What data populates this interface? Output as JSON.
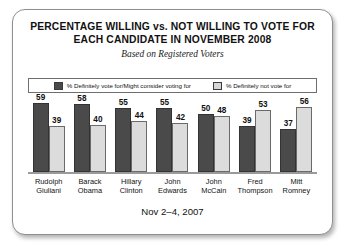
{
  "card": {
    "title_line1": "PERCENTAGE WILLING vs. NOT WILLING TO VOTE FOR",
    "title_line2": "EACH CANDIDATE IN NOVEMBER 2008",
    "subtitle": "Based on Registered Voters",
    "footer": "Nov 2–4, 2007"
  },
  "legend": {
    "series1_label": "% Definitely vote for/Might consider voting for",
    "series1_color": "#4a4a4a",
    "series2_label": "% Definitely not vote for",
    "series2_color": "#dcdcdc"
  },
  "chart_data": {
    "type": "bar",
    "title": "PERCENTAGE WILLING vs. NOT WILLING TO VOTE FOR EACH CANDIDATE IN NOVEMBER 2008",
    "subtitle": "Based on Registered Voters",
    "xlabel": "",
    "ylabel": "",
    "ylim": [
      0,
      60
    ],
    "grid": false,
    "legend_position": "top",
    "note": "Nov 2–4, 2007",
    "categories": [
      "Rudolph Giuliani",
      "Barack Obama",
      "Hillary Clinton",
      "John Edwards",
      "John McCain",
      "Fred Thompson",
      "Mitt Romney"
    ],
    "category_lines": [
      [
        "Rudolph",
        "Giuliani"
      ],
      [
        "Barack",
        "Obama"
      ],
      [
        "Hillary",
        "Clinton"
      ],
      [
        "John",
        "Edwards"
      ],
      [
        "John",
        "McCain"
      ],
      [
        "Fred",
        "Thompson"
      ],
      [
        "Mitt",
        "Romney"
      ]
    ],
    "series": [
      {
        "name": "% Definitely vote for/Might consider voting for",
        "color": "#4a4a4a",
        "values": [
          59,
          58,
          55,
          55,
          50,
          39,
          37
        ]
      },
      {
        "name": "% Definitely not vote for",
        "color": "#dcdcdc",
        "values": [
          39,
          40,
          44,
          42,
          48,
          53,
          56
        ]
      }
    ]
  }
}
